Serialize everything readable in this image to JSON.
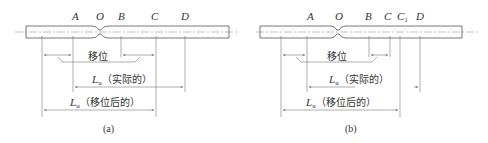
{
  "figure": {
    "panels": [
      {
        "id": "a",
        "caption": "(a)",
        "points": {
          "A": "A",
          "O": "O",
          "B": "B",
          "C": "C",
          "D": "D"
        },
        "shift_label": "移位",
        "lu_actual": {
          "symbol": "L",
          "subscript": "u",
          "text": "（实际的）"
        },
        "lu_shifted": {
          "symbol": "L",
          "subscript": "u",
          "text": "（移位后的）"
        }
      },
      {
        "id": "b",
        "caption": "(b)",
        "points": {
          "A": "A",
          "O": "O",
          "B": "B",
          "C": "C",
          "C1": "C",
          "C1_sub": "1",
          "D": "D"
        },
        "shift_label": "移位",
        "lu_actual": {
          "symbol": "L",
          "subscript": "u",
          "text": "（实际的）"
        },
        "lu_shifted": {
          "symbol": "L",
          "subscript": "u",
          "text": "（移位后的）"
        }
      }
    ]
  }
}
